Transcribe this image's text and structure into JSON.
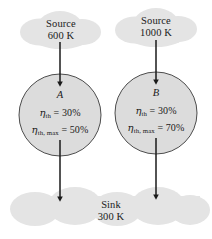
{
  "figure": {
    "background_color": "#ffffff",
    "cloud_fill": "#e4e4e4",
    "circle_fill": "#dcdcdc",
    "outline_color": "#3a3a3a",
    "arrow_color": "#1a1a1a"
  },
  "sources": [
    {
      "id": "source-left",
      "label": "Source",
      "temperature": "600 K"
    },
    {
      "id": "source-right",
      "label": "Source",
      "temperature": "1000 K"
    }
  ],
  "engines": [
    {
      "id": "engine-a",
      "letter": "A",
      "eta_symbol": "η",
      "eta_subscript": "th",
      "eta_value": "= 30%",
      "eta_max_symbol": "η",
      "eta_max_subscript": "th, max",
      "eta_max_value": "= 50%"
    },
    {
      "id": "engine-b",
      "letter": "B",
      "eta_symbol": "η",
      "eta_subscript": "th",
      "eta_value": "= 30%",
      "eta_max_symbol": "η",
      "eta_max_subscript": "th, max",
      "eta_max_value": "= 70%"
    }
  ],
  "sink": {
    "id": "sink",
    "label": "Sink",
    "temperature": "300 K"
  },
  "arrows": [
    {
      "id": "arrow-source-left-to-engine-a",
      "direction": "down"
    },
    {
      "id": "arrow-source-right-to-engine-b",
      "direction": "down"
    },
    {
      "id": "arrow-engine-a-to-sink",
      "direction": "down"
    },
    {
      "id": "arrow-engine-b-to-sink",
      "direction": "down"
    }
  ]
}
